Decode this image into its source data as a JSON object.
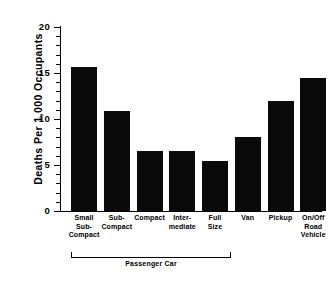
{
  "chart_data": {
    "type": "bar",
    "title": "",
    "xlabel": "",
    "ylabel": "Deaths Per 1,000 Occupants",
    "ylim": [
      0,
      20
    ],
    "grid": false,
    "legend": "none",
    "y_major_ticks": [
      "0",
      "5",
      "10",
      "15",
      "20"
    ],
    "y_major_values": [
      0,
      5,
      10,
      15,
      20
    ],
    "y_minor_values": [
      1,
      2,
      3,
      4,
      6,
      7,
      8,
      9,
      11,
      12,
      13,
      14,
      16,
      17,
      18,
      19
    ],
    "y_minor_step": 1,
    "categories": [
      "Small Sub-Compact",
      "Sub-Compact",
      "Compact",
      "Inter-mediate",
      "Full Size",
      "Van",
      "Pickup",
      "On/Off Road Vehicle"
    ],
    "category_label_lines": [
      [
        "Small",
        "Sub-",
        "Compact"
      ],
      [
        "Sub-",
        "Compact"
      ],
      [
        "Compact"
      ],
      [
        "Inter-",
        "mediate"
      ],
      [
        "Full",
        "Size"
      ],
      [
        "Van"
      ],
      [
        "Pickup"
      ],
      [
        "On/Off",
        "Road",
        "Vehicle"
      ]
    ],
    "values": [
      15.6,
      10.9,
      6.5,
      6.5,
      5.4,
      8.0,
      12.0,
      14.5
    ],
    "bar_color": "#0a0a0a",
    "groups": [
      {
        "label": "Passenger Car",
        "first_category_index": 0,
        "last_category_index": 4
      }
    ]
  }
}
